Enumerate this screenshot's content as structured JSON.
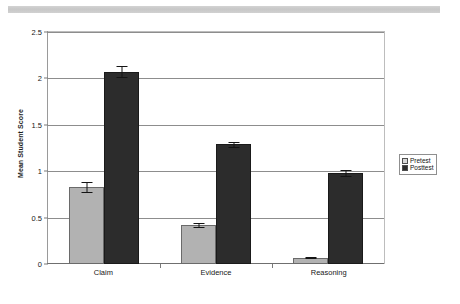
{
  "chart_data": {
    "type": "bar",
    "title": "",
    "subtitle": "",
    "xlabel": "",
    "ylabel": "Mean Student Score",
    "categories": [
      "Claim",
      "Evidence",
      "Reasoning"
    ],
    "series": [
      {
        "name": "Pretest",
        "color": "#b2b2b2",
        "values": [
          0.83,
          0.42,
          0.07
        ],
        "errors": [
          0.05,
          0.02,
          0.01
        ]
      },
      {
        "name": "Posttest",
        "color": "#2c2c2c",
        "values": [
          2.07,
          1.29,
          0.98
        ],
        "errors": [
          0.06,
          0.03,
          0.03
        ]
      }
    ],
    "ylim": [
      0,
      2.5
    ],
    "yticks": [
      0,
      0.5,
      1,
      1.5,
      2,
      2.5
    ],
    "ytick_labels": [
      "0",
      "0.5",
      "1",
      "1.5",
      "2",
      "2.5"
    ],
    "grid": true,
    "grid_axis": "y",
    "legend_position": "right",
    "error_bars": true
  },
  "legend": {
    "entries": [
      {
        "label": "Pretest",
        "swatch": "pretest-swatch-icon"
      },
      {
        "label": "Posttest",
        "swatch": "posttest-swatch-icon"
      }
    ]
  },
  "axes": {
    "y_title": "Mean Student Score",
    "y_labels": [
      "2.5",
      "2",
      "1.5",
      "1",
      "0.5",
      "0"
    ],
    "x_labels": [
      "Claim",
      "Evidence",
      "Reasoning"
    ]
  }
}
